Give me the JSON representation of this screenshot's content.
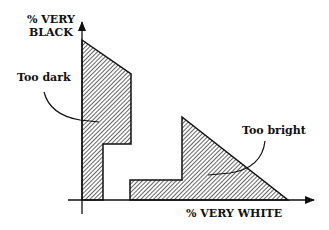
{
  "diagram": {
    "y_axis_label_line1": "% VERY",
    "y_axis_label_line2": "BLACK",
    "x_axis_label": "% VERY WHITE",
    "region_labels": {
      "too_dark": "Too dark",
      "too_bright": "Too bright"
    },
    "colors": {
      "stroke": "#111111",
      "hatch": "#222222",
      "background": "#ffffff"
    }
  }
}
